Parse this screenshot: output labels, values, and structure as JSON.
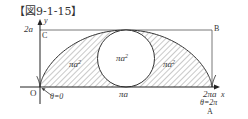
{
  "figure": {
    "title": "【図9-1-15】"
  },
  "axes": {
    "x_label": "x",
    "y_label": "y",
    "y_tick_2a": "2a",
    "origin_label": "O"
  },
  "points": {
    "C": "C",
    "B": "B",
    "A": "A"
  },
  "annotations": {
    "theta_start": "θ=0",
    "theta_end": "θ=2π",
    "x_mid": "πa",
    "x_end": "2πa"
  },
  "regions": {
    "left_area": "πa",
    "left_area_exp": "2",
    "circle_area": "πa",
    "circle_area_exp": "2",
    "right_area": "πa",
    "right_area_exp": "2"
  },
  "colors": {
    "line": "#444444",
    "hatch": "#777777",
    "axis": "#222222",
    "background": "#ffffff"
  }
}
